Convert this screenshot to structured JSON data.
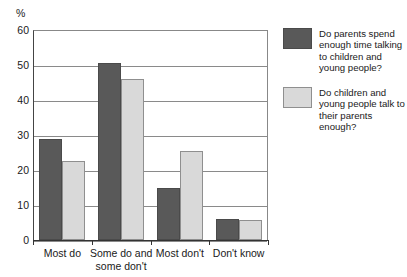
{
  "chart_data": {
    "type": "bar",
    "title": "",
    "subtitle": "",
    "xlabel": "",
    "ylabel": "%",
    "ylim": [
      0,
      60
    ],
    "yticks": [
      0,
      10,
      20,
      30,
      40,
      50,
      60
    ],
    "ytick_labels": [
      "0",
      "10",
      "20",
      "30",
      "40",
      "50",
      "60"
    ],
    "grid": true,
    "legend_position": "right",
    "categories": [
      "Most do",
      "Some do and\nsome don't",
      "Most don't",
      "Don't know"
    ],
    "series": [
      {
        "name": "Do parents spend enough time talking to children and young people?",
        "color": "#595959",
        "values": [
          29,
          50.5,
          15,
          6
        ]
      },
      {
        "name": "Do children and young people talk to their parents enough?",
        "color": "#d9d9d9",
        "values": [
          22.5,
          46,
          25.5,
          5.7
        ]
      }
    ]
  },
  "legend": {
    "entries": [
      {
        "swatch": "dark-gray-swatch",
        "label": "Do parents spend enough time talking to children and young people?"
      },
      {
        "swatch": "light-gray-swatch",
        "label": "Do children and young people talk to their parents enough?"
      }
    ]
  },
  "axis": {
    "y_unit_label": "%"
  },
  "colors": {
    "series_a": "#595959",
    "series_b": "#d9d9d9",
    "gridline": "#8a8a8a",
    "axis": "#333333",
    "text": "#1a1a1a",
    "background": "#ffffff"
  }
}
